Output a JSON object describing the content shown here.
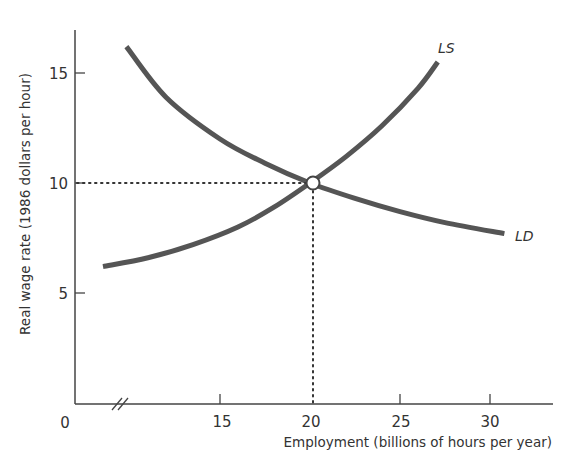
{
  "chart_data": {
    "type": "line",
    "title": "",
    "xlabel": "Employment (billions of hours per year)",
    "ylabel": "Real wage rate (1986 dollars per hour)",
    "xlim": [
      0,
      33
    ],
    "ylim": [
      0,
      17
    ],
    "x_axis_break": true,
    "grid": false,
    "legend": "none (curves labelled directly)",
    "x_ticks": [
      15,
      20,
      25,
      30
    ],
    "y_ticks": [
      5,
      10,
      15
    ],
    "origin_label": "0",
    "series": [
      {
        "name": "LD",
        "label": "LD",
        "description": "Labor demand (downward sloping)",
        "points": [
          [
            9.8,
            16.2
          ],
          [
            12,
            13.9
          ],
          [
            15,
            12.0
          ],
          [
            17.5,
            10.9
          ],
          [
            20,
            10
          ],
          [
            22.5,
            9.3
          ],
          [
            25,
            8.7
          ],
          [
            27.5,
            8.2
          ],
          [
            30.8,
            7.7
          ]
        ]
      },
      {
        "name": "LS",
        "label": "LS",
        "description": "Labor supply (upward sloping)",
        "points": [
          [
            8.5,
            6.2
          ],
          [
            11,
            6.6
          ],
          [
            13.5,
            7.2
          ],
          [
            16,
            8.0
          ],
          [
            18,
            8.9
          ],
          [
            20,
            10
          ],
          [
            22,
            11.2
          ],
          [
            24,
            12.6
          ],
          [
            26,
            14.3
          ],
          [
            27.1,
            15.5
          ]
        ]
      }
    ],
    "annotations": [
      {
        "type": "equilibrium-point",
        "x": 20,
        "y": 10,
        "marker": "open circle"
      },
      {
        "type": "dotted-guide",
        "from": [
          0,
          10
        ],
        "to": [
          20,
          10
        ]
      },
      {
        "type": "dotted-guide",
        "from": [
          20,
          10
        ],
        "to": [
          20,
          0
        ]
      }
    ]
  },
  "labels": {
    "x_ticks": [
      "15",
      "20",
      "25",
      "30"
    ],
    "y_ticks": [
      "5",
      "10",
      "15"
    ],
    "origin": "0",
    "xlabel": "Employment (billions of hours per year)",
    "ylabel": "Real wage rate (1986 dollars per hour)",
    "ls": "LS",
    "ld": "LD"
  },
  "colors": {
    "curve": "#555555",
    "axis": "#444444",
    "text": "#333333"
  }
}
